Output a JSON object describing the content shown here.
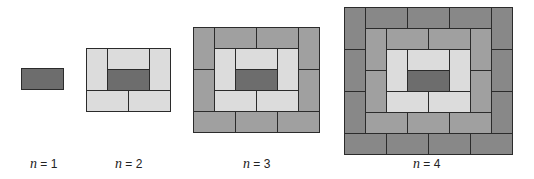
{
  "diagram": {
    "unit_px": 21,
    "colors": {
      "center": "#6d6d6d",
      "ring1": "#dcdcdc",
      "ring2": "#a0a0a0",
      "ring3": "#888888",
      "border": "#2b2b2b"
    },
    "figures": [
      {
        "n": 1,
        "label_var": "n",
        "label_rest": " = 1",
        "x": 21,
        "y": 68,
        "label_x": 30,
        "bricks": [
          {
            "c": 0,
            "r": 0,
            "w": 2,
            "h": 1,
            "ring": "center"
          }
        ]
      },
      {
        "n": 2,
        "label_var": "n",
        "label_rest": " = 2",
        "x": 86,
        "y": 48,
        "label_x": 115,
        "bricks": [
          {
            "c": 0,
            "r": 0,
            "w": 1,
            "h": 2,
            "ring": "ring1"
          },
          {
            "c": 1,
            "r": 0,
            "w": 2,
            "h": 1,
            "ring": "ring1"
          },
          {
            "c": 3,
            "r": 0,
            "w": 1,
            "h": 2,
            "ring": "ring1"
          },
          {
            "c": 1,
            "r": 1,
            "w": 2,
            "h": 1,
            "ring": "center"
          },
          {
            "c": 0,
            "r": 2,
            "w": 2,
            "h": 1,
            "ring": "ring1"
          },
          {
            "c": 2,
            "r": 2,
            "w": 2,
            "h": 1,
            "ring": "ring1"
          }
        ]
      },
      {
        "n": 3,
        "label_var": "n",
        "label_rest": " = 3",
        "x": 193,
        "y": 27,
        "label_x": 243,
        "bricks": [
          {
            "c": 0,
            "r": 0,
            "w": 1,
            "h": 2,
            "ring": "ring2"
          },
          {
            "c": 0,
            "r": 2,
            "w": 1,
            "h": 2,
            "ring": "ring2"
          },
          {
            "c": 1,
            "r": 0,
            "w": 2,
            "h": 1,
            "ring": "ring2"
          },
          {
            "c": 3,
            "r": 0,
            "w": 2,
            "h": 1,
            "ring": "ring2"
          },
          {
            "c": 5,
            "r": 0,
            "w": 1,
            "h": 2,
            "ring": "ring2"
          },
          {
            "c": 5,
            "r": 2,
            "w": 1,
            "h": 2,
            "ring": "ring2"
          },
          {
            "c": 0,
            "r": 4,
            "w": 2,
            "h": 1,
            "ring": "ring2"
          },
          {
            "c": 2,
            "r": 4,
            "w": 2,
            "h": 1,
            "ring": "ring2"
          },
          {
            "c": 4,
            "r": 4,
            "w": 2,
            "h": 1,
            "ring": "ring2"
          },
          {
            "c": 1,
            "r": 1,
            "w": 1,
            "h": 2,
            "ring": "ring1"
          },
          {
            "c": 2,
            "r": 1,
            "w": 2,
            "h": 1,
            "ring": "ring1"
          },
          {
            "c": 4,
            "r": 1,
            "w": 1,
            "h": 2,
            "ring": "ring1"
          },
          {
            "c": 2,
            "r": 2,
            "w": 2,
            "h": 1,
            "ring": "center"
          },
          {
            "c": 1,
            "r": 3,
            "w": 2,
            "h": 1,
            "ring": "ring1"
          },
          {
            "c": 3,
            "r": 3,
            "w": 2,
            "h": 1,
            "ring": "ring1"
          }
        ]
      },
      {
        "n": 4,
        "label_var": "n",
        "label_rest": " = 4",
        "x": 344,
        "y": 7,
        "label_x": 413,
        "bricks": [
          {
            "c": 0,
            "r": 0,
            "w": 1,
            "h": 2,
            "ring": "ring3"
          },
          {
            "c": 0,
            "r": 2,
            "w": 1,
            "h": 2,
            "ring": "ring3"
          },
          {
            "c": 0,
            "r": 4,
            "w": 1,
            "h": 2,
            "ring": "ring3"
          },
          {
            "c": 1,
            "r": 0,
            "w": 2,
            "h": 1,
            "ring": "ring3"
          },
          {
            "c": 3,
            "r": 0,
            "w": 2,
            "h": 1,
            "ring": "ring3"
          },
          {
            "c": 5,
            "r": 0,
            "w": 2,
            "h": 1,
            "ring": "ring3"
          },
          {
            "c": 7,
            "r": 0,
            "w": 1,
            "h": 2,
            "ring": "ring3"
          },
          {
            "c": 7,
            "r": 2,
            "w": 1,
            "h": 2,
            "ring": "ring3"
          },
          {
            "c": 7,
            "r": 4,
            "w": 1,
            "h": 2,
            "ring": "ring3"
          },
          {
            "c": 0,
            "r": 6,
            "w": 2,
            "h": 1,
            "ring": "ring3"
          },
          {
            "c": 2,
            "r": 6,
            "w": 2,
            "h": 1,
            "ring": "ring3"
          },
          {
            "c": 4,
            "r": 6,
            "w": 2,
            "h": 1,
            "ring": "ring3"
          },
          {
            "c": 6,
            "r": 6,
            "w": 2,
            "h": 1,
            "ring": "ring3"
          },
          {
            "c": 1,
            "r": 1,
            "w": 1,
            "h": 2,
            "ring": "ring2"
          },
          {
            "c": 1,
            "r": 3,
            "w": 1,
            "h": 2,
            "ring": "ring2"
          },
          {
            "c": 2,
            "r": 1,
            "w": 2,
            "h": 1,
            "ring": "ring2"
          },
          {
            "c": 4,
            "r": 1,
            "w": 2,
            "h": 1,
            "ring": "ring2"
          },
          {
            "c": 6,
            "r": 1,
            "w": 1,
            "h": 2,
            "ring": "ring2"
          },
          {
            "c": 6,
            "r": 3,
            "w": 1,
            "h": 2,
            "ring": "ring2"
          },
          {
            "c": 1,
            "r": 5,
            "w": 2,
            "h": 1,
            "ring": "ring2"
          },
          {
            "c": 3,
            "r": 5,
            "w": 2,
            "h": 1,
            "ring": "ring2"
          },
          {
            "c": 5,
            "r": 5,
            "w": 2,
            "h": 1,
            "ring": "ring2"
          },
          {
            "c": 2,
            "r": 2,
            "w": 1,
            "h": 2,
            "ring": "ring1"
          },
          {
            "c": 3,
            "r": 2,
            "w": 2,
            "h": 1,
            "ring": "ring1"
          },
          {
            "c": 5,
            "r": 2,
            "w": 1,
            "h": 2,
            "ring": "ring1"
          },
          {
            "c": 3,
            "r": 3,
            "w": 2,
            "h": 1,
            "ring": "center"
          },
          {
            "c": 2,
            "r": 4,
            "w": 2,
            "h": 1,
            "ring": "ring1"
          },
          {
            "c": 4,
            "r": 4,
            "w": 2,
            "h": 1,
            "ring": "ring1"
          }
        ]
      }
    ]
  }
}
